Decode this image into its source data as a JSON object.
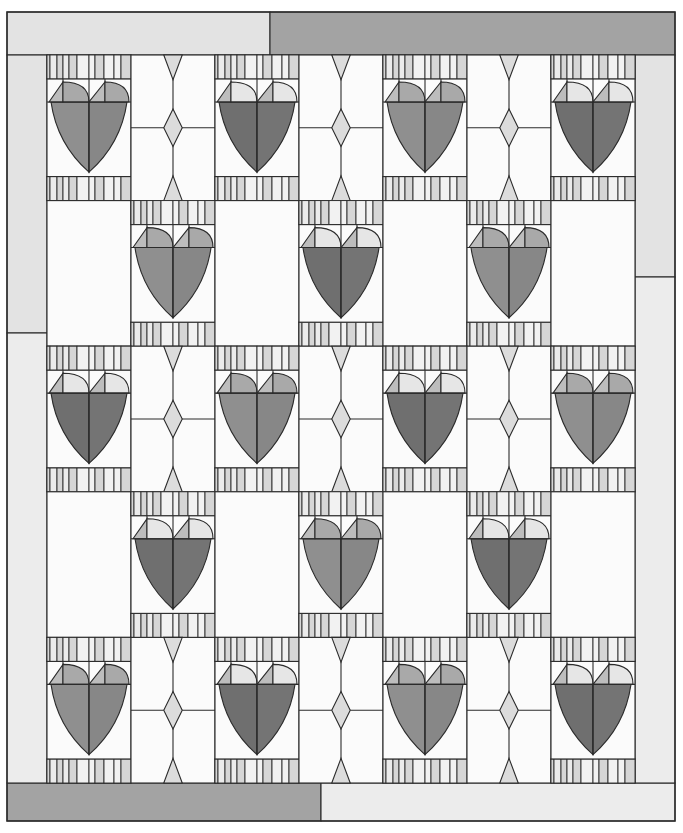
{
  "quilt": {
    "title": "Heart quilt layout",
    "outer": {
      "x": 7,
      "y": 12,
      "w": 668,
      "h": 809
    },
    "grid": {
      "x": 47,
      "y": 55,
      "cols": 7,
      "rows": 5,
      "cell_w": 84,
      "cell_h": 145.6
    },
    "colors": {
      "outline": "#2b2b2b",
      "white": "#fbfbfb",
      "strip_light": "#ebebeb",
      "strip_mid": "#d6d6d6",
      "strip_pale": "#f2f2f2",
      "diamond": "#dcdcdc",
      "heart_medium": "#8f8f8f",
      "heart_medium_right": "#878787",
      "heart_dark": "#6f6f6f",
      "heart_dark_right": "#747474",
      "lobe_medium": "#a9a9a9",
      "lobe_light": "#e6e6e6",
      "lobe_triangle": "#bdbdbd",
      "border_light": "#e3e3e3",
      "border_medium": "#a3a3a3",
      "border_lighter": "#ececec"
    },
    "borders": {
      "top": [
        {
          "x": 7,
          "w": 263,
          "fill": "border_light"
        },
        {
          "x": 270,
          "w": 405,
          "fill": "border_medium"
        }
      ],
      "bottom": [
        {
          "x": 7,
          "w": 314,
          "fill": "border_medium"
        },
        {
          "x": 321,
          "w": 354,
          "fill": "border_lighter"
        }
      ],
      "left": [
        {
          "y": 55,
          "h": 278,
          "fill": "border_light"
        },
        {
          "y": 333,
          "h": 450,
          "fill": "border_lighter"
        }
      ],
      "right": [
        {
          "y": 55,
          "h": 222,
          "fill": "border_light"
        },
        {
          "y": 277,
          "h": 506,
          "fill": "border_lighter"
        }
      ],
      "top_h": 43,
      "bottom_y": 783,
      "bottom_h": 38,
      "left_w": 40,
      "right_x": 635,
      "right_w": 40
    },
    "layout": [
      [
        "heart-M",
        "sash",
        "heart-D",
        "sash",
        "heart-M",
        "sash",
        "heart-D"
      ],
      [
        "blank",
        "heart-M",
        "blank",
        "heart-D",
        "blank",
        "heart-M",
        "blank"
      ],
      [
        "heart-D",
        "sash",
        "heart-M",
        "sash",
        "heart-D",
        "sash",
        "heart-M"
      ],
      [
        "blank",
        "heart-D",
        "blank",
        "heart-M",
        "blank",
        "heart-D",
        "blank"
      ],
      [
        "heart-M",
        "sash",
        "heart-D",
        "sash",
        "heart-M",
        "sash",
        "heart-D"
      ]
    ],
    "strip_pattern": [
      "strip_mid",
      "strip_light",
      "strip_mid",
      "strip_light",
      "strip_mid",
      "strip_pale",
      "strip_pale",
      "strip_mid",
      "strip_pale",
      "strip_pale",
      "strip_mid"
    ],
    "strip_widths": [
      3,
      7,
      6,
      6,
      8,
      12,
      6,
      9,
      10,
      7,
      10
    ]
  }
}
